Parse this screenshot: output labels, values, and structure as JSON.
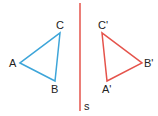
{
  "diagram": {
    "colors": {
      "original": "#3da5d9",
      "image": "#e5534b",
      "mirror": "#e5534b",
      "label": "#222222"
    },
    "mirror_line": {
      "label": "s",
      "x1": 80,
      "y1": 3,
      "x2": 80,
      "y2": 111
    },
    "original_triangle": {
      "vertices": [
        {
          "name": "A",
          "x": 20,
          "y": 63
        },
        {
          "name": "B",
          "x": 55,
          "y": 81
        },
        {
          "name": "C",
          "x": 60,
          "y": 33
        }
      ]
    },
    "image_triangle": {
      "vertices": [
        {
          "name": "A'",
          "x": 107,
          "y": 81
        },
        {
          "name": "B'",
          "x": 142,
          "y": 63
        },
        {
          "name": "C'",
          "x": 102,
          "y": 33
        }
      ]
    },
    "labels": {
      "A": "A",
      "B": "B",
      "C": "C",
      "A_prime": "A'",
      "B_prime": "B'",
      "C_prime": "C'",
      "s": "s"
    }
  }
}
